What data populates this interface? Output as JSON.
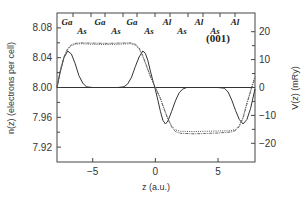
{
  "chart_data": {
    "type": "line",
    "title": "",
    "xlabel": "z (a.u.)",
    "ylabel": "n(z) (electrons per cell)",
    "y2label": "V(z) (mRy)",
    "xlim": [
      -7.85,
      7.95
    ],
    "ylim": [
      7.9,
      8.1
    ],
    "y2lim": [
      -26.7,
      26.7
    ],
    "x_ticks": [
      -5,
      0,
      5
    ],
    "x_tick_labels": [
      "−5",
      "0",
      "5"
    ],
    "y_ticks": [
      7.92,
      7.96,
      8.0,
      8.04,
      8.08
    ],
    "y_tick_labels": [
      "7.92",
      "7.96",
      "8.00",
      "8.04",
      "8.08"
    ],
    "y_minor_ticks": [
      7.94,
      7.98,
      8.02,
      8.06
    ],
    "y2_ticks": [
      -20,
      -10,
      0,
      10,
      20
    ],
    "y2_tick_labels": [
      "−20",
      "−10",
      "0",
      "10",
      "20"
    ],
    "y2_minor_ticks": [
      -15,
      -5,
      5,
      15
    ],
    "grid": false,
    "reference_line": {
      "y": 8.0,
      "style": "solid"
    },
    "annotations": [
      {
        "text": "(001)",
        "x": 5.0,
        "y": 8.061
      }
    ],
    "atom_labels": [
      {
        "text": "Ga",
        "x": -6.6,
        "row": "upper"
      },
      {
        "text": "As",
        "x": -5.1,
        "row": "lower"
      },
      {
        "text": "Ga",
        "x": -2.6,
        "row": "upper"
      },
      {
        "text": "As",
        "x": -1.1,
        "row": "lower"
      },
      {
        "text": "Ga",
        "x": 1.3,
        "row": "upper"
      },
      {
        "text": "As",
        "x": 2.4,
        "row": "lower"
      },
      {
        "text": "Al",
        "x": 5.2,
        "row": "upper"
      },
      {
        "text": "As",
        "x": 6.5,
        "row": "lower"
      },
      {
        "text": "Al",
        "x": 8.9,
        "row": "upper"
      },
      {
        "text": "As",
        "x": 10.4,
        "row": "lower"
      },
      {
        "text": "Al",
        "x": 12.6,
        "row": "upper"
      }
    ],
    "top_ticks_x": [
      -6.6,
      -5.2,
      -4.0,
      -2.6,
      -1.4,
      0.0,
      1.2,
      2.6,
      3.8,
      5.2,
      6.4
    ],
    "series": [
      {
        "name": "n(z)",
        "axis": "left",
        "style": "solid",
        "x": [
          -7.85,
          -7.6,
          -7.3,
          -7.0,
          -6.7,
          -6.4,
          -6.1,
          -5.8,
          -5.5,
          -5.0,
          -4.0,
          -3.0,
          -2.5,
          -2.2,
          -1.9,
          -1.6,
          -1.3,
          -1.0,
          -0.8,
          -0.6,
          -0.4,
          -0.2,
          0.0,
          0.2,
          0.4,
          0.6,
          0.8,
          1.0,
          1.3,
          1.6,
          1.9,
          2.2,
          2.5,
          3.0,
          4.0,
          5.0,
          5.5,
          5.8,
          6.1,
          6.4,
          6.7,
          7.0,
          7.3,
          7.6,
          7.95
        ],
        "y": [
          8.0,
          8.02,
          8.04,
          8.049,
          8.045,
          8.032,
          8.016,
          8.006,
          8.001,
          8.0,
          8.0,
          8.0,
          8.001,
          8.005,
          8.014,
          8.028,
          8.041,
          8.049,
          8.046,
          8.036,
          8.022,
          8.009,
          7.997,
          7.983,
          7.968,
          7.956,
          7.951,
          7.955,
          7.968,
          7.982,
          7.993,
          7.998,
          8.0,
          8.0,
          8.0,
          8.0,
          7.999,
          7.994,
          7.983,
          7.969,
          7.957,
          7.951,
          7.957,
          7.972,
          7.998
        ]
      },
      {
        "name": "V(z) dotted",
        "axis": "right",
        "style": "dotted",
        "x": [
          -7.85,
          -7.6,
          -7.3,
          -7.0,
          -6.7,
          -6.4,
          -6.0,
          -5.0,
          -4.0,
          -3.0,
          -2.0,
          -1.6,
          -1.3,
          -1.0,
          -0.7,
          -0.4,
          0.0,
          0.4,
          0.7,
          1.0,
          1.3,
          1.6,
          2.0,
          3.0,
          4.0,
          5.0,
          6.0,
          6.4,
          6.7,
          7.0,
          7.3,
          7.6,
          7.95
        ],
        "y": [
          0.0,
          5.5,
          10.5,
          13.6,
          15.0,
          15.5,
          15.7,
          15.5,
          15.4,
          15.5,
          15.7,
          15.2,
          13.8,
          11.0,
          7.5,
          3.8,
          0.0,
          -3.8,
          -7.5,
          -11.0,
          -13.8,
          -15.2,
          -15.7,
          -15.8,
          -15.7,
          -15.6,
          -15.5,
          -15.0,
          -13.6,
          -10.5,
          -5.5,
          -1.0,
          4.0
        ]
      },
      {
        "name": "V(z) dash-dot",
        "axis": "right",
        "style": "dashdot",
        "x": [
          -7.85,
          -7.6,
          -7.3,
          -7.0,
          -6.7,
          -6.4,
          -6.0,
          -5.0,
          -4.0,
          -3.0,
          -2.0,
          -1.6,
          -1.3,
          -1.0,
          -0.7,
          -0.4,
          0.0,
          0.4,
          0.7,
          1.0,
          1.3,
          1.6,
          2.0,
          3.0,
          4.0,
          5.0,
          6.0,
          6.4,
          6.7,
          7.0,
          7.3,
          7.6,
          7.95
        ],
        "y": [
          0.5,
          6.0,
          11.0,
          14.0,
          15.3,
          15.8,
          16.0,
          15.9,
          15.8,
          15.9,
          16.0,
          15.6,
          14.2,
          11.4,
          7.8,
          4.0,
          0.0,
          -4.0,
          -7.8,
          -11.4,
          -14.2,
          -15.8,
          -16.4,
          -16.6,
          -16.5,
          -16.3,
          -16.0,
          -15.4,
          -14.0,
          -11.0,
          -6.0,
          -1.5,
          3.5
        ]
      }
    ]
  }
}
